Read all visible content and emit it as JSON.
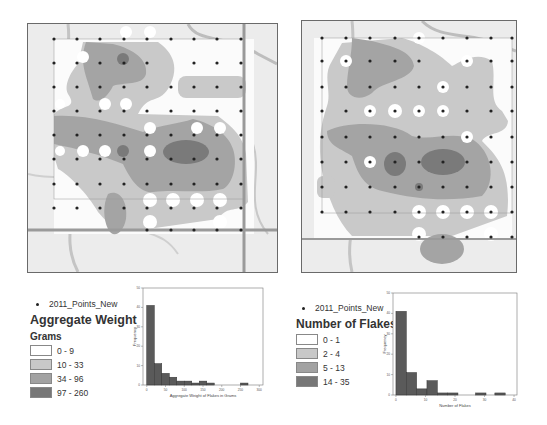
{
  "maps": [
    {
      "name": "aggregate-weight-map",
      "frame": {
        "x": 27,
        "y": 23,
        "w": 249,
        "h": 248
      }
    },
    {
      "name": "number-of-flakes-map",
      "frame": {
        "x": 301,
        "y": 20,
        "w": 214,
        "h": 251
      }
    }
  ],
  "legends": [
    {
      "points_label": "2011_Points_New",
      "title": "Aggregate Weight",
      "subtitle": "Grams",
      "classes": [
        {
          "label": "0 - 9",
          "color": "#ffffff"
        },
        {
          "label": "10 - 33",
          "color": "#c8c8c8"
        },
        {
          "label": "34 - 96",
          "color": "#a2a2a2"
        },
        {
          "label": "97 - 260",
          "color": "#777777"
        }
      ]
    },
    {
      "points_label": "2011_Points_New",
      "title": "Number of Flakes",
      "subtitle": "",
      "classes": [
        {
          "label": "0 - 1",
          "color": "#ffffff"
        },
        {
          "label": "2 - 4",
          "color": "#c8c8c8"
        },
        {
          "label": "5 - 13",
          "color": "#a2a2a2"
        },
        {
          "label": "14 - 35",
          "color": "#777777"
        }
      ]
    }
  ],
  "chart_data": [
    {
      "type": "bar",
      "title": "",
      "xlabel": "Aggregate Weight of Flakes in Grams",
      "ylabel": "Frequency",
      "x_ticks": [
        0,
        50,
        100,
        150,
        200,
        250,
        300
      ],
      "y_ticks": [
        0,
        10,
        20,
        30,
        40,
        50
      ],
      "ylim": [
        0,
        50
      ],
      "xlim": [
        -10,
        310
      ],
      "bin_width": 20,
      "bins_start": [
        0,
        20,
        40,
        60,
        80,
        100,
        120,
        140,
        160,
        180,
        200,
        220,
        240,
        260
      ],
      "values": [
        41,
        11,
        6,
        4,
        2,
        2,
        1,
        2,
        1,
        0,
        0,
        0,
        0,
        0
      ],
      "extra_bins": [
        {
          "start": 250,
          "value": 1
        }
      ],
      "grid": false
    },
    {
      "type": "bar",
      "title": "",
      "xlabel": "Number of Flakes",
      "ylabel": "Frequency",
      "x_ticks": [
        0,
        10,
        20,
        30,
        40
      ],
      "y_ticks": [
        0,
        10,
        20,
        30,
        40,
        50
      ],
      "ylim": [
        0,
        50
      ],
      "xlim": [
        -1,
        41
      ],
      "bin_width": 3.5,
      "bins_start": [
        0,
        3.5,
        7,
        10.5,
        14,
        17.5
      ],
      "values": [
        41,
        11,
        3,
        7,
        1,
        1
      ],
      "extra_bins": [
        {
          "start": 27,
          "value": 1
        },
        {
          "start": 33.5,
          "value": 1
        }
      ],
      "grid": false
    }
  ]
}
